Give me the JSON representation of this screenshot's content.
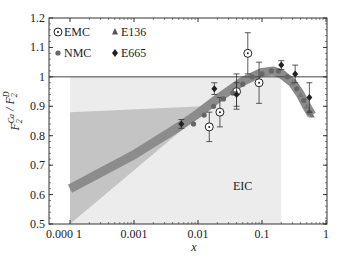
{
  "chart_data": {
    "type": "scatter",
    "title": "",
    "xlabel": "x",
    "ylabel": "F2^Ca / F2^D",
    "ylabel_main": "F",
    "ylabel_sup1": "Ca",
    "ylabel_sub1": "2",
    "ylabel_sup2": "D",
    "ylabel_sub2": "2",
    "xscale": "log",
    "xlim": [
      0.0001,
      1
    ],
    "ylim": [
      0.5,
      1.2
    ],
    "xticks": [
      "0.000 1",
      "0.001",
      "0.01",
      "0.1",
      "1"
    ],
    "yticks": [
      "0.5",
      "0.6",
      "0.7",
      "0.8",
      "0.9",
      "1",
      "1.1",
      "1.2"
    ],
    "reference_line": 1.0,
    "legend": [
      {
        "label": "EMC",
        "marker": "circle-dot"
      },
      {
        "label": "E136",
        "marker": "triangle"
      },
      {
        "label": "NMC",
        "marker": "filled-circle"
      },
      {
        "label": "E665",
        "marker": "diamond"
      }
    ],
    "annotation": "EIC",
    "eic_region": {
      "x": [
        0.0001,
        0.2
      ],
      "y": [
        0.5,
        1.0
      ]
    },
    "uncertainty_wedge": {
      "x": [
        0.0001,
        0.012
      ],
      "y_upper": [
        0.88,
        0.9
      ],
      "y_lower": [
        0.5,
        0.88
      ]
    },
    "theory_band": {
      "x": [
        0.0001,
        0.001,
        0.005,
        0.01,
        0.02,
        0.05,
        0.1,
        0.15,
        0.2,
        0.3,
        0.4,
        0.5,
        0.6
      ],
      "y": [
        0.62,
        0.735,
        0.83,
        0.875,
        0.925,
        0.985,
        1.015,
        1.02,
        1.01,
        0.98,
        0.94,
        0.9,
        0.87
      ]
    },
    "series": [
      {
        "name": "EMC",
        "points": [
          {
            "x": 0.015,
            "y": 0.83,
            "err": 0.05
          },
          {
            "x": 0.022,
            "y": 0.88,
            "err": 0.05
          },
          {
            "x": 0.04,
            "y": 0.95,
            "err": 0.06
          },
          {
            "x": 0.06,
            "y": 1.08,
            "err": 0.07
          },
          {
            "x": 0.09,
            "y": 0.98,
            "err": 0.07
          }
        ]
      },
      {
        "name": "NMC",
        "points": [
          {
            "x": 0.0085,
            "y": 0.84
          },
          {
            "x": 0.0125,
            "y": 0.87
          },
          {
            "x": 0.0175,
            "y": 0.9
          },
          {
            "x": 0.025,
            "y": 0.925
          },
          {
            "x": 0.035,
            "y": 0.945
          },
          {
            "x": 0.05,
            "y": 0.975
          },
          {
            "x": 0.07,
            "y": 1.0
          },
          {
            "x": 0.1,
            "y": 1.01
          },
          {
            "x": 0.14,
            "y": 1.02
          },
          {
            "x": 0.18,
            "y": 1.02
          },
          {
            "x": 0.25,
            "y": 1.0
          },
          {
            "x": 0.35,
            "y": 0.96
          },
          {
            "x": 0.45,
            "y": 0.92
          },
          {
            "x": 0.55,
            "y": 0.88
          }
        ]
      },
      {
        "name": "E136",
        "points": [
          {
            "x": 0.3,
            "y": 0.98
          },
          {
            "x": 0.4,
            "y": 0.94
          },
          {
            "x": 0.5,
            "y": 0.9
          },
          {
            "x": 0.6,
            "y": 0.87
          }
        ]
      },
      {
        "name": "E665",
        "points": [
          {
            "x": 0.0055,
            "y": 0.84,
            "err": 0.015
          },
          {
            "x": 0.018,
            "y": 0.96,
            "err": 0.02
          },
          {
            "x": 0.04,
            "y": 0.94,
            "err": 0.04
          },
          {
            "x": 0.2,
            "y": 1.04,
            "err": 0.015
          },
          {
            "x": 0.33,
            "y": 1.01,
            "err": 0.03
          },
          {
            "x": 0.55,
            "y": 0.93,
            "err": 0.05
          }
        ]
      }
    ]
  }
}
